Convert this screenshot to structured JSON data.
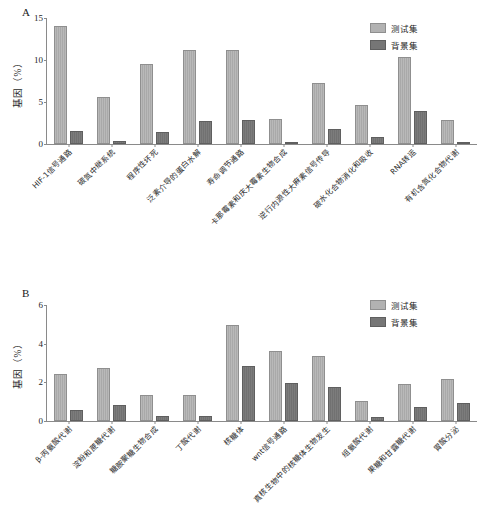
{
  "figure": {
    "panelA_letter": "A",
    "panelB_letter": "B"
  },
  "legend": {
    "test_label": "测试集",
    "background_label": "背景集",
    "test_color": "#b2b2b2",
    "background_color": "#767676"
  },
  "chart_data": [
    {
      "panel": "A",
      "type": "bar",
      "title": "A",
      "xlabel": "",
      "ylabel": "基因（%）",
      "ylim": [
        0,
        15
      ],
      "yticks": [
        0,
        5,
        10,
        15
      ],
      "grid": false,
      "legend_position": "top-right",
      "categories": [
        "HIF-1信号通路",
        "碳氮中继系统",
        "程序性坏死",
        "泛素介导的蛋白水解",
        "寿命调节通路",
        "卡那霉素和庆大霉素生物合成",
        "逆行内源性大麻素信号传导",
        "碳水化合物消化和吸收",
        "RNA转运",
        "有机含氮化合物代谢"
      ],
      "series": [
        {
          "name": "测试集",
          "values": [
            14.1,
            5.6,
            9.5,
            11.2,
            11.2,
            3.0,
            7.3,
            4.7,
            10.3,
            2.9
          ]
        },
        {
          "name": "背景集",
          "values": [
            1.5,
            0.3,
            1.4,
            2.7,
            2.8,
            0.05,
            1.8,
            0.8,
            3.9,
            0.15
          ]
        }
      ]
    },
    {
      "panel": "B",
      "type": "bar",
      "title": "B",
      "xlabel": "",
      "ylabel": "基因（%）",
      "ylim": [
        0,
        6
      ],
      "yticks": [
        0,
        2,
        4,
        6
      ],
      "grid": false,
      "legend_position": "top-right",
      "categories": [
        "β-丙氨酸代谢",
        "淀粉和蔗糖代谢",
        "糖胺聚糖生物合成",
        "丁酸代谢",
        "核糖体",
        "wnt信号通路",
        "真核生物中的核糖体生物发生",
        "组氨酸代谢",
        "果糖和甘露糖代谢",
        "胃酸分泌"
      ],
      "series": [
        {
          "name": "测试集",
          "values": [
            2.45,
            2.75,
            1.35,
            1.35,
            4.95,
            3.6,
            3.35,
            1.05,
            1.9,
            2.15
          ]
        },
        {
          "name": "背景集",
          "values": [
            0.55,
            0.85,
            0.25,
            0.25,
            2.85,
            1.95,
            1.75,
            0.2,
            0.75,
            0.95
          ]
        }
      ]
    }
  ]
}
